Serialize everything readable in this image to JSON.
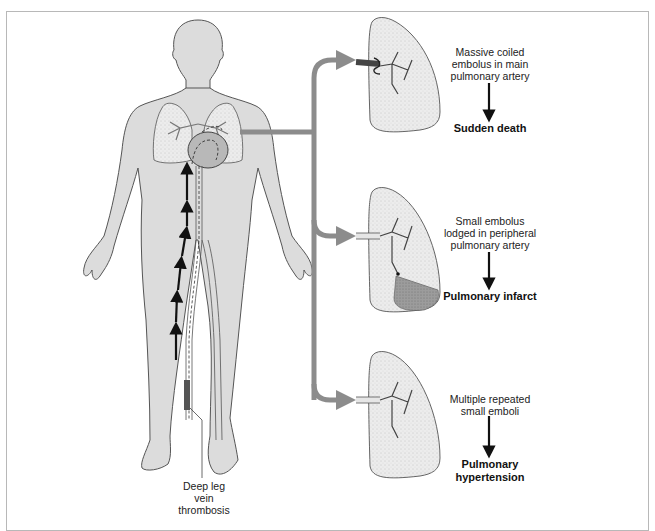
{
  "figure": {
    "colors": {
      "body_fill": "#dcdcdc",
      "outline": "#555555",
      "connector": "#8c8c8c",
      "lung_fill": "#ececec",
      "infarct_fill": "#9a9a9a",
      "text": "#222222"
    }
  },
  "source": {
    "label": "Deep leg vein\nthrombosis"
  },
  "outcomes": [
    {
      "cause": "Massive coiled\nembolus in main\npulmonary artery",
      "result": "Sudden death"
    },
    {
      "cause": "Small embolus\nlodged in peripheral\npulmonary artery",
      "result": "Pulmonary infarct"
    },
    {
      "cause": "Multiple repeated\nsmall emboli",
      "result": "Pulmonary\nhypertension"
    }
  ]
}
